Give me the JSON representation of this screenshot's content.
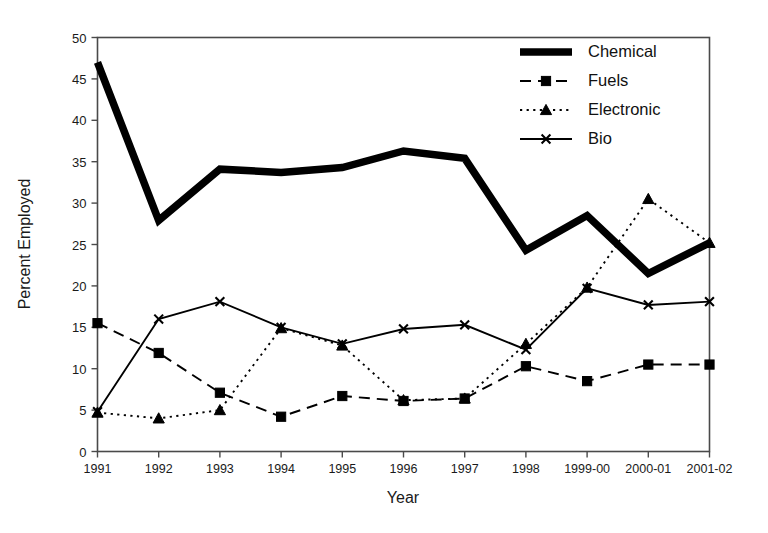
{
  "chart_data": {
    "type": "line",
    "title": "",
    "xlabel": "Year",
    "ylabel": "Percent Employed",
    "categories": [
      "1991",
      "1992",
      "1993",
      "1994",
      "1995",
      "1996",
      "1997",
      "1998",
      "1999-00",
      "2000-01",
      "2001-02"
    ],
    "ylim": [
      0,
      50
    ],
    "yticks": [
      0,
      5,
      10,
      15,
      20,
      25,
      30,
      35,
      40,
      45,
      50
    ],
    "grid": false,
    "legend_position": "top-right",
    "series": [
      {
        "name": "Chemical",
        "style": "thick-solid",
        "marker": "none",
        "color": "#000000",
        "values": [
          47.0,
          27.9,
          34.1,
          33.7,
          34.3,
          36.3,
          35.4,
          24.3,
          28.5,
          21.5,
          25.2
        ]
      },
      {
        "name": "Fuels",
        "style": "dashed",
        "marker": "square",
        "color": "#000000",
        "values": [
          15.5,
          11.9,
          7.1,
          4.2,
          6.7,
          6.1,
          6.4,
          10.3,
          8.5,
          10.5,
          10.5
        ]
      },
      {
        "name": "Electronic",
        "style": "dotted",
        "marker": "triangle",
        "color": "#000000",
        "values": [
          4.7,
          4.0,
          5.0,
          14.9,
          12.8,
          6.2,
          6.4,
          13.0,
          19.8,
          30.5,
          25.2
        ]
      },
      {
        "name": "Bio",
        "style": "solid",
        "marker": "x",
        "color": "#000000",
        "values": [
          4.8,
          16.0,
          18.1,
          15.0,
          13.0,
          14.8,
          15.3,
          12.3,
          19.7,
          17.7,
          18.1
        ]
      }
    ]
  },
  "axis": {
    "y_title": "Percent Employed",
    "x_title": "Year",
    "y_tick_labels": [
      "0",
      "5",
      "10",
      "15",
      "20",
      "25",
      "30",
      "35",
      "40",
      "45",
      "50"
    ],
    "x_tick_labels": [
      "1991",
      "1992",
      "1993",
      "1994",
      "1995",
      "1996",
      "1997",
      "1998",
      "1999-00",
      "2000-01",
      "2001-02"
    ]
  },
  "legend": {
    "items": [
      {
        "label": "Chemical"
      },
      {
        "label": "Fuels"
      },
      {
        "label": "Electronic"
      },
      {
        "label": "Bio"
      }
    ]
  },
  "colors": {
    "ink": "#000000",
    "axis": "#4a4a4a",
    "background": "#ffffff"
  }
}
